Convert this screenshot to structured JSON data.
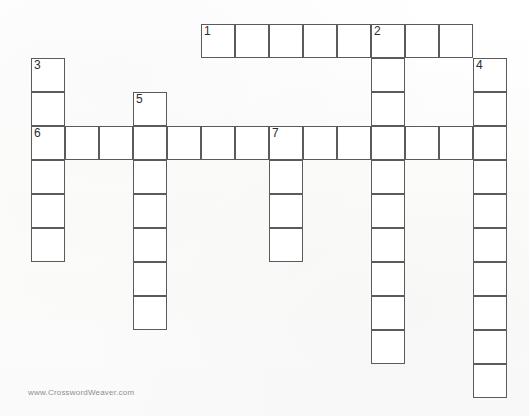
{
  "page": {
    "watermark": "www.CrosswordWeaver.com",
    "background_color": "#ffffff",
    "cell_fill_color": "#ffffff",
    "cell_border_color": "#5b5b5e",
    "number_color": "#2c2c2e",
    "watermark_color": "#8e8e90"
  },
  "grid": {
    "cell_size_px": 34,
    "origin_x_px": 31,
    "origin_y_px": 24,
    "columns": 14,
    "rows": 11,
    "total_cells": 53,
    "numbered_cells": [
      "1",
      "2",
      "3",
      "4",
      "5",
      "6",
      "7"
    ],
    "entries": [
      {
        "number": "1",
        "direction": "across",
        "length": 8,
        "start_col": 5,
        "start_row": 0
      },
      {
        "number": "2",
        "direction": "down",
        "length": 10,
        "start_col": 10,
        "start_row": 0
      },
      {
        "number": "3",
        "direction": "down",
        "length": 6,
        "start_col": 0,
        "start_row": 1
      },
      {
        "number": "4",
        "direction": "down",
        "length": 10,
        "start_col": 13,
        "start_row": 1
      },
      {
        "number": "5",
        "direction": "down",
        "length": 7,
        "start_col": 3,
        "start_row": 2
      },
      {
        "number": "6",
        "direction": "across",
        "length": 14,
        "start_col": 0,
        "start_row": 3
      },
      {
        "number": "7",
        "direction": "down",
        "length": 4,
        "start_col": 7,
        "start_row": 3
      }
    ],
    "cells": [
      {
        "col": 5,
        "row": 0,
        "number": "1"
      },
      {
        "col": 6,
        "row": 0,
        "number": ""
      },
      {
        "col": 7,
        "row": 0,
        "number": ""
      },
      {
        "col": 8,
        "row": 0,
        "number": ""
      },
      {
        "col": 9,
        "row": 0,
        "number": ""
      },
      {
        "col": 10,
        "row": 0,
        "number": "2"
      },
      {
        "col": 11,
        "row": 0,
        "number": ""
      },
      {
        "col": 12,
        "row": 0,
        "number": ""
      },
      {
        "col": 0,
        "row": 1,
        "number": "3"
      },
      {
        "col": 10,
        "row": 1,
        "number": ""
      },
      {
        "col": 13,
        "row": 1,
        "number": "4"
      },
      {
        "col": 0,
        "row": 2,
        "number": ""
      },
      {
        "col": 3,
        "row": 2,
        "number": "5"
      },
      {
        "col": 10,
        "row": 2,
        "number": ""
      },
      {
        "col": 13,
        "row": 2,
        "number": ""
      },
      {
        "col": 0,
        "row": 3,
        "number": "6"
      },
      {
        "col": 1,
        "row": 3,
        "number": ""
      },
      {
        "col": 2,
        "row": 3,
        "number": ""
      },
      {
        "col": 3,
        "row": 3,
        "number": ""
      },
      {
        "col": 4,
        "row": 3,
        "number": ""
      },
      {
        "col": 5,
        "row": 3,
        "number": ""
      },
      {
        "col": 6,
        "row": 3,
        "number": ""
      },
      {
        "col": 7,
        "row": 3,
        "number": "7"
      },
      {
        "col": 8,
        "row": 3,
        "number": ""
      },
      {
        "col": 9,
        "row": 3,
        "number": ""
      },
      {
        "col": 10,
        "row": 3,
        "number": ""
      },
      {
        "col": 11,
        "row": 3,
        "number": ""
      },
      {
        "col": 12,
        "row": 3,
        "number": ""
      },
      {
        "col": 13,
        "row": 3,
        "number": ""
      },
      {
        "col": 0,
        "row": 4,
        "number": ""
      },
      {
        "col": 3,
        "row": 4,
        "number": ""
      },
      {
        "col": 7,
        "row": 4,
        "number": ""
      },
      {
        "col": 10,
        "row": 4,
        "number": ""
      },
      {
        "col": 13,
        "row": 4,
        "number": ""
      },
      {
        "col": 0,
        "row": 5,
        "number": ""
      },
      {
        "col": 3,
        "row": 5,
        "number": ""
      },
      {
        "col": 7,
        "row": 5,
        "number": ""
      },
      {
        "col": 10,
        "row": 5,
        "number": ""
      },
      {
        "col": 13,
        "row": 5,
        "number": ""
      },
      {
        "col": 0,
        "row": 6,
        "number": ""
      },
      {
        "col": 3,
        "row": 6,
        "number": ""
      },
      {
        "col": 7,
        "row": 6,
        "number": ""
      },
      {
        "col": 10,
        "row": 6,
        "number": ""
      },
      {
        "col": 13,
        "row": 6,
        "number": ""
      },
      {
        "col": 3,
        "row": 7,
        "number": ""
      },
      {
        "col": 10,
        "row": 7,
        "number": ""
      },
      {
        "col": 13,
        "row": 7,
        "number": ""
      },
      {
        "col": 3,
        "row": 8,
        "number": ""
      },
      {
        "col": 10,
        "row": 8,
        "number": ""
      },
      {
        "col": 13,
        "row": 8,
        "number": ""
      },
      {
        "col": 10,
        "row": 9,
        "number": ""
      },
      {
        "col": 13,
        "row": 9,
        "number": ""
      },
      {
        "col": 13,
        "row": 10,
        "number": ""
      }
    ]
  }
}
